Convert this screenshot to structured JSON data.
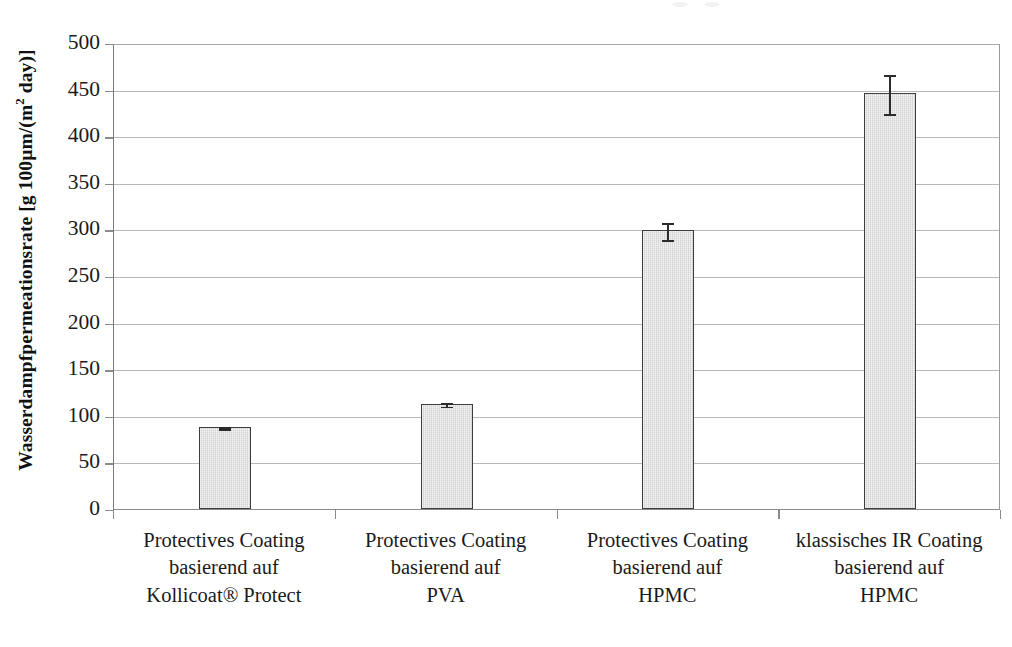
{
  "chart_data": {
    "type": "bar",
    "title": "",
    "subtitle": "",
    "xlabel": "",
    "ylabel": "Wasserdampfpermeationsrate [g 100µm/(m² day)]",
    "ylabel_parts": {
      "before_sup": "Wasserdampfpermeationsrate [g 100µm/(m",
      "sup": "2",
      "after_sup": " day)]"
    },
    "categories": [
      "Protectives Coating basierend auf Kollicoat® Protect",
      "Protectives Coating basierend auf PVA",
      "Protectives Coating basierend auf HPMC",
      "klassisches IR Coating basierend auf HPMC"
    ],
    "category_label_lines": [
      [
        "Protectives Coating",
        "basierend auf",
        "Kollicoat® Protect"
      ],
      [
        "Protectives Coating",
        "basierend auf",
        "PVA"
      ],
      [
        "Protectives Coating",
        "basierend auf",
        "HPMC"
      ],
      [
        "klassisches IR Coating",
        "basierend auf",
        "HPMC"
      ]
    ],
    "values": [
      88,
      113,
      299,
      446
    ],
    "errors": [
      2,
      3,
      10,
      22
    ],
    "ylim": [
      0,
      500
    ],
    "ytick_values": [
      0,
      50,
      100,
      150,
      200,
      250,
      300,
      350,
      400,
      450,
      500
    ],
    "ytick_labels": [
      "0",
      "50",
      "100",
      "150",
      "200",
      "250",
      "300",
      "350",
      "400",
      "450",
      "500"
    ],
    "grid": {
      "horizontal": true,
      "vertical": false
    },
    "legend": {
      "visible": false,
      "position": "none",
      "entries": []
    },
    "bar_style": {
      "fill": "#d2d2d2",
      "edge": "#3d3d3d",
      "errorbar_color": "#2b2b2b"
    },
    "annotations": []
  },
  "figure": {
    "background": "#ffffff",
    "axis_color": "#8b8b8b",
    "gridline_color": "#b9b9b9"
  }
}
